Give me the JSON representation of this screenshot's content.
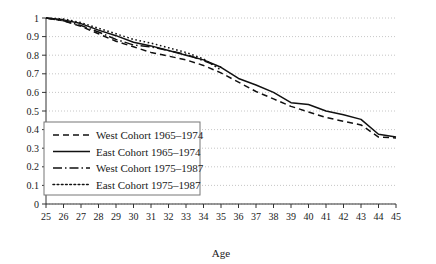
{
  "chart_data": {
    "type": "line",
    "title": "",
    "xlabel": "Age",
    "ylabel": "",
    "xlim": [
      25,
      45
    ],
    "ylim": [
      0,
      1
    ],
    "grid": true,
    "legend_position": "lower-left-inside",
    "xticks": [
      25,
      26,
      27,
      28,
      29,
      30,
      31,
      32,
      33,
      34,
      35,
      36,
      37,
      38,
      39,
      40,
      41,
      42,
      43,
      44,
      45
    ],
    "yticks": [
      0,
      0.1,
      0.2,
      0.3,
      0.4,
      0.5,
      0.6,
      0.7,
      0.8,
      0.9,
      1
    ],
    "xtick_labels": [
      "25",
      "26",
      "27",
      "28",
      "29",
      "30",
      "31",
      "32",
      "33",
      "34",
      "35",
      "36",
      "37",
      "38",
      "39",
      "40",
      "41",
      "42",
      "43",
      "44",
      "45"
    ],
    "ytick_labels": [
      "0",
      "0.1",
      "0.2",
      "0.3",
      "0.4",
      "0.5",
      "0.6",
      "0.7",
      "0.8",
      "0.9",
      "1"
    ],
    "series": [
      {
        "name": "West Cohort 1965–1974",
        "dash": "dashed",
        "x": [
          25,
          26,
          27,
          28,
          29,
          30,
          31,
          32,
          33,
          34,
          35,
          36,
          37,
          38,
          39,
          40,
          41,
          42,
          43,
          44,
          45
        ],
        "values": [
          1.0,
          0.985,
          0.955,
          0.915,
          0.875,
          0.845,
          0.815,
          0.795,
          0.775,
          0.745,
          0.705,
          0.655,
          0.605,
          0.565,
          0.525,
          0.495,
          0.465,
          0.445,
          0.425,
          0.36,
          0.355
        ]
      },
      {
        "name": "East Cohort 1965–1974",
        "dash": "solid",
        "x": [
          25,
          26,
          27,
          28,
          29,
          30,
          31,
          32,
          33,
          34,
          35,
          36,
          37,
          38,
          39,
          40,
          41,
          42,
          43,
          44,
          45
        ],
        "values": [
          1.0,
          0.99,
          0.97,
          0.935,
          0.905,
          0.87,
          0.85,
          0.825,
          0.8,
          0.775,
          0.735,
          0.675,
          0.64,
          0.6,
          0.545,
          0.535,
          0.5,
          0.48,
          0.455,
          0.375,
          0.36
        ]
      },
      {
        "name": "West Cohort 1975–1987",
        "dash": "dashdot",
        "x": [
          25,
          26,
          27,
          28,
          29,
          30,
          31,
          32,
          33,
          34,
          35
        ],
        "values": [
          1.0,
          0.985,
          0.96,
          0.925,
          0.885,
          0.855,
          0.845,
          0.825,
          0.805,
          0.77,
          0.735
        ]
      },
      {
        "name": "East Cohort 1975–1987",
        "dash": "dotted",
        "x": [
          25,
          26,
          27,
          28,
          29,
          30,
          31,
          32,
          33,
          34,
          35
        ],
        "values": [
          1.0,
          0.995,
          0.975,
          0.945,
          0.915,
          0.885,
          0.865,
          0.84,
          0.815,
          0.78,
          0.72
        ]
      }
    ]
  },
  "legend": {
    "items": [
      {
        "label": "West Cohort 1965–1974",
        "dash": "dashed"
      },
      {
        "label": "East Cohort 1965–1974",
        "dash": "solid"
      },
      {
        "label": "West Cohort 1975–1987",
        "dash": "dashdot"
      },
      {
        "label": "East Cohort 1975–1987",
        "dash": "dotted"
      }
    ]
  },
  "style": {
    "line_color": "#111111",
    "grid_color": "#b8b8b8",
    "axis_color": "#333333",
    "background": "#ffffff"
  }
}
